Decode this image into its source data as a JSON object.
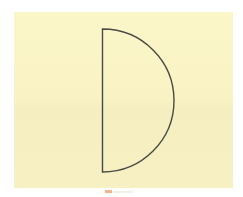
{
  "figure": {
    "background_color": "#ffffff",
    "panel_color": "#f9f3c4",
    "shape": {
      "type": "semicircle",
      "stroke_color": "#4a4a45",
      "flat_side": "left",
      "curve_side": "right"
    },
    "marker": {
      "color": "#f0a070"
    }
  }
}
